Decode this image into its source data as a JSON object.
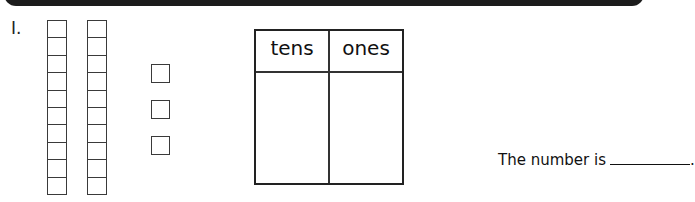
{
  "header": {
    "bar_color": "#1c1c1c"
  },
  "problem": {
    "number_label": "I.",
    "base_ten_blocks": {
      "tens_rods": 2,
      "cells_per_rod": 10,
      "ones_cubes": 3
    },
    "place_value_table": {
      "headers": [
        "tens",
        "ones"
      ],
      "values": [
        "",
        ""
      ]
    },
    "answer": {
      "prompt": "The number is",
      "blank_value": "",
      "end_punctuation": "."
    }
  }
}
